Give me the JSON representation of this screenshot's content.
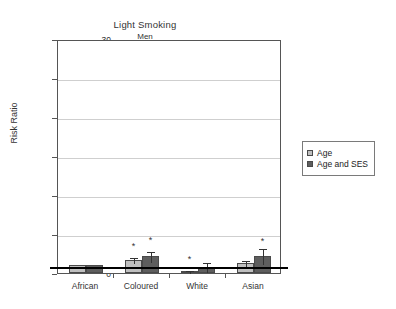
{
  "chart_data": {
    "type": "bar",
    "title": "Light Smoking",
    "subtitle": "Men",
    "xlabel": "",
    "ylabel": "Risk Ratio",
    "ylim": [
      0,
      30
    ],
    "yticks": [
      0,
      5,
      10,
      15,
      20,
      25,
      30
    ],
    "grid": "horizontal",
    "legend_position": "right",
    "reference_line": 1,
    "categories": [
      "African",
      "Coloured",
      "White",
      "Asian"
    ],
    "series": [
      {
        "name": "Age",
        "color": "#bfbfbf",
        "values": [
          1.0,
          1.7,
          0.3,
          1.3
        ],
        "err_low": [
          0.0,
          0.35,
          0.15,
          0.35
        ],
        "err_high": [
          0.0,
          0.45,
          0.15,
          0.45
        ],
        "significant": [
          false,
          true,
          true,
          false
        ],
        "star_y": [
          null,
          3.9,
          2.2,
          null
        ]
      },
      {
        "name": "Age and SES",
        "color": "#5e5e5e",
        "values": [
          1.0,
          2.2,
          0.8,
          2.2
        ],
        "err_low": [
          0.0,
          0.6,
          0.55,
          0.9
        ],
        "err_high": [
          0.0,
          0.7,
          0.75,
          1.1
        ],
        "significant": [
          false,
          true,
          false,
          true
        ],
        "star_y": [
          null,
          4.6,
          null,
          4.5
        ]
      }
    ]
  },
  "legend": {
    "items": [
      {
        "label": "Age"
      },
      {
        "label": "Age and SES"
      }
    ]
  }
}
